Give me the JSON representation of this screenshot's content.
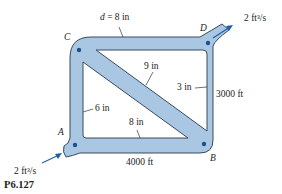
{
  "figure": {
    "id": "P6.127",
    "colors": {
      "pipe_fill": "#a9c6e3",
      "pipe_stroke": "#3a4a5c",
      "node": "#1e4f8f",
      "arrow": "#1e5fa8"
    },
    "nodes": [
      {
        "name": "A",
        "label": "A"
      },
      {
        "name": "B",
        "label": "B"
      },
      {
        "name": "C",
        "label": "C"
      },
      {
        "name": "D",
        "label": "D"
      }
    ],
    "pipes": {
      "top": {
        "label": "d = 8 in",
        "d_prefix": "d",
        "d_rest": " = 8 in"
      },
      "right": {
        "diameter": "3 in",
        "length": "3000 ft"
      },
      "left": {
        "diameter": "6 in"
      },
      "diagonal": {
        "diameter": "9 in"
      },
      "bottom": {
        "diameter": "8 in",
        "length": "4000 ft"
      }
    },
    "flows": {
      "inlet": {
        "node": "A",
        "value": "2 ft³/s"
      },
      "outlet": {
        "node": "D",
        "value": "2 ft³/s"
      }
    }
  }
}
